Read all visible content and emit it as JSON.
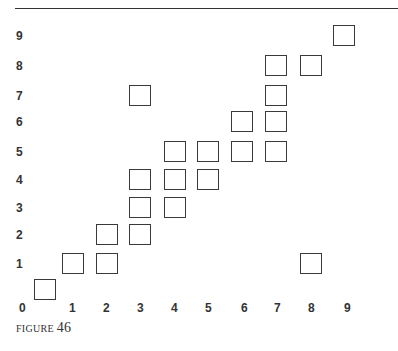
{
  "caption": {
    "label": "FIGURE",
    "number": "46"
  },
  "chart_data": {
    "type": "scatter",
    "title": "",
    "caption": "FIGURE 46",
    "xlabel": "",
    "ylabel": "",
    "x_ticks": [
      0,
      1,
      2,
      3,
      4,
      5,
      6,
      7,
      8,
      9
    ],
    "y_ticks": [
      1,
      2,
      3,
      4,
      5,
      6,
      7,
      8,
      9
    ],
    "xlim": [
      0,
      9
    ],
    "ylim": [
      0,
      9
    ],
    "marker": "open-square",
    "grid": false,
    "points": [
      {
        "x": 0,
        "y": 0
      },
      {
        "x": 1,
        "y": 1
      },
      {
        "x": 2,
        "y": 1
      },
      {
        "x": 2,
        "y": 2
      },
      {
        "x": 3,
        "y": 2
      },
      {
        "x": 3,
        "y": 3
      },
      {
        "x": 3,
        "y": 4
      },
      {
        "x": 3,
        "y": 7
      },
      {
        "x": 4,
        "y": 3
      },
      {
        "x": 4,
        "y": 4
      },
      {
        "x": 4,
        "y": 5
      },
      {
        "x": 5,
        "y": 4
      },
      {
        "x": 5,
        "y": 5
      },
      {
        "x": 6,
        "y": 5
      },
      {
        "x": 6,
        "y": 6
      },
      {
        "x": 7,
        "y": 5
      },
      {
        "x": 7,
        "y": 6
      },
      {
        "x": 7,
        "y": 7
      },
      {
        "x": 7,
        "y": 8
      },
      {
        "x": 8,
        "y": 1
      },
      {
        "x": 8,
        "y": 8
      },
      {
        "x": 9,
        "y": 9
      }
    ]
  },
  "layout": {
    "x_centers": [
      45,
      73,
      107,
      140,
      175,
      208,
      242,
      276,
      311,
      344
    ],
    "x_label_centers": [
      23,
      73,
      107,
      141,
      175,
      209,
      245,
      278,
      312,
      348
    ],
    "y_centers": [
      290,
      264,
      235,
      208,
      180,
      152,
      122,
      96,
      66,
      36
    ],
    "x_label_top": 302
  }
}
